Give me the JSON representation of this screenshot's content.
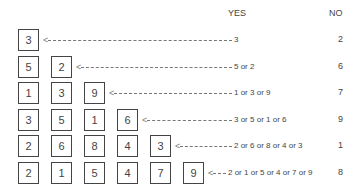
{
  "headers": {
    "yes": "YES",
    "no": "NO"
  },
  "rows": [
    {
      "boxes": [
        "3"
      ],
      "yes": "3",
      "no": "2"
    },
    {
      "boxes": [
        "5",
        "2"
      ],
      "yes": "5 or 2",
      "no": "6"
    },
    {
      "boxes": [
        "1",
        "3",
        "9"
      ],
      "yes": "1 or 3 or 9",
      "no": "7"
    },
    {
      "boxes": [
        "3",
        "5",
        "1",
        "6"
      ],
      "yes": "3 or 5 or 1 or 6",
      "no": "9"
    },
    {
      "boxes": [
        "2",
        "6",
        "8",
        "4",
        "3"
      ],
      "yes": "2 or 6 or 8 or 4 or 3",
      "no": "1"
    },
    {
      "boxes": [
        "2",
        "1",
        "5",
        "4",
        "7",
        "9"
      ],
      "yes": "2 or 1 or 5 or 4 or 7 or 9",
      "no": "8"
    }
  ]
}
